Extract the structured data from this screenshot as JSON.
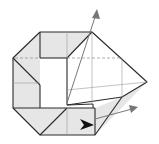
{
  "diagram": {
    "type": "origami-fold-step",
    "colors": {
      "paper_shade": "#e6e6e6",
      "paper_white": "#ffffff",
      "edge": "#2a2a2a",
      "arrow": "#777777",
      "push_arrow": "#111111"
    },
    "arrows": [
      {
        "kind": "fold-direction",
        "direction": "up-right"
      },
      {
        "kind": "fold-direction",
        "direction": "right"
      },
      {
        "kind": "push-arrowhead",
        "direction": "right"
      }
    ]
  }
}
